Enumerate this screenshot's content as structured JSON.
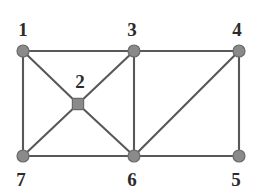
{
  "figure": {
    "name": "undirected-graph-diagram",
    "width": 260,
    "height": 194,
    "background_color": "#ffffff"
  },
  "style": {
    "node_fill": "#8a8a8a",
    "node_stroke": "#6a6a6a",
    "edge_color": "#585858",
    "label_color": "#2b2b2b"
  },
  "nodes": [
    {
      "id": "1",
      "label": "1",
      "x": 23,
      "y": 51,
      "shape": "circle",
      "r": 6.0,
      "label_x": 23,
      "label_y": 29
    },
    {
      "id": "2",
      "label": "2",
      "x": 78,
      "y": 104,
      "shape": "square",
      "r": 5.6,
      "label_x": 80,
      "label_y": 81
    },
    {
      "id": "3",
      "label": "3",
      "x": 134,
      "y": 51,
      "shape": "circle",
      "r": 6.0,
      "label_x": 132,
      "label_y": 29
    },
    {
      "id": "4",
      "label": "4",
      "x": 239,
      "y": 51,
      "shape": "circle",
      "r": 6.0,
      "label_x": 237,
      "label_y": 29
    },
    {
      "id": "5",
      "label": "5",
      "x": 239,
      "y": 156,
      "shape": "circle",
      "r": 6.0,
      "label_x": 236,
      "label_y": 179
    },
    {
      "id": "6",
      "label": "6",
      "x": 134,
      "y": 156,
      "shape": "circle",
      "r": 6.0,
      "label_x": 132,
      "label_y": 179
    },
    {
      "id": "7",
      "label": "7",
      "x": 23,
      "y": 156,
      "shape": "circle",
      "r": 6.0,
      "label_x": 21,
      "label_y": 179
    }
  ],
  "edges": [
    {
      "from": "1",
      "to": "3"
    },
    {
      "from": "1",
      "to": "7"
    },
    {
      "from": "1",
      "to": "2"
    },
    {
      "from": "2",
      "to": "3"
    },
    {
      "from": "2",
      "to": "7"
    },
    {
      "from": "2",
      "to": "6"
    },
    {
      "from": "3",
      "to": "4"
    },
    {
      "from": "3",
      "to": "6"
    },
    {
      "from": "4",
      "to": "5"
    },
    {
      "from": "4",
      "to": "6"
    },
    {
      "from": "7",
      "to": "6"
    },
    {
      "from": "6",
      "to": "5"
    }
  ]
}
